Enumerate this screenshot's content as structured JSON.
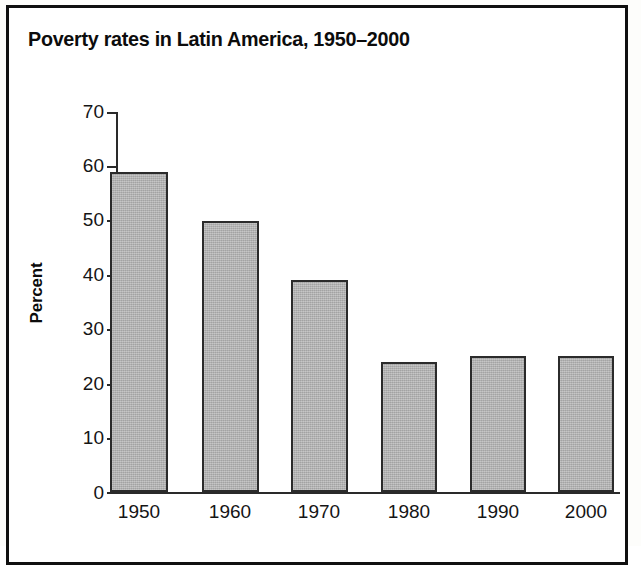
{
  "figure": {
    "title": "Poverty rates in Latin America, 1950–2000",
    "frame_color": "#101010",
    "bar_fill_color": "#b3b3b3",
    "bar_outline_color": "#2b2b2b",
    "axis_color": "#2a2a2a",
    "background_color": "#ffffff"
  },
  "chart_data": {
    "type": "bar",
    "title": "Poverty rates in Latin America, 1950–2000",
    "xlabel": "",
    "ylabel": "Percent",
    "categories": [
      "1950",
      "1960",
      "1970",
      "1980",
      "1990",
      "2000"
    ],
    "values": [
      59,
      50,
      39,
      24,
      25,
      25
    ],
    "ylim": [
      0,
      70
    ],
    "yticks": [
      "0",
      "10",
      "20",
      "30",
      "40",
      "50",
      "60",
      "70"
    ],
    "ytick_values": [
      0,
      10,
      20,
      30,
      40,
      50,
      60,
      70
    ],
    "grid": false,
    "legend": false,
    "series": [
      {
        "name": "Poverty rate",
        "values": [
          59,
          50,
          39,
          24,
          25,
          25
        ]
      }
    ]
  }
}
